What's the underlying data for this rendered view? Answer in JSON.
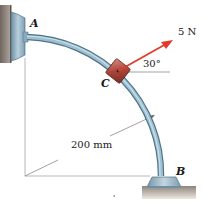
{
  "diagram": {
    "type": "statics-curved-rod",
    "labels": {
      "point_a": "A",
      "point_b": "B",
      "point_c": "C",
      "force": "5 N",
      "angle": "30°",
      "radius": "200 mm",
      "stray_mark": "'"
    },
    "colors": {
      "rod": "#8fb4c8",
      "rod_edge": "#4d7285",
      "collar": "#b04a3c",
      "force_arrow": "#e23b2e",
      "wall": "#8a7f78",
      "ground": "#9a8f86",
      "support": "#9bb7c7",
      "construction_line": "#9a9a9a"
    }
  }
}
